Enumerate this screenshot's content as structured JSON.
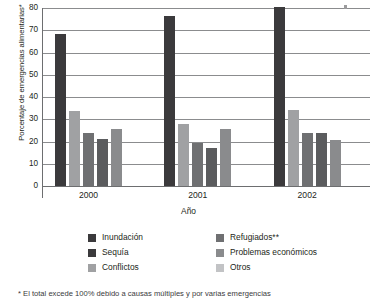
{
  "chart_data": {
    "type": "bar",
    "title": "",
    "subtitle": "",
    "xlabel": "Año",
    "ylabel": "Porcentaje de emergencias alimentarias*",
    "categories": [
      "2000",
      "2001",
      "2002"
    ],
    "ylim": [
      0,
      80
    ],
    "yticks": [
      0,
      10,
      20,
      30,
      40,
      50,
      60,
      70,
      80
    ],
    "ytick_labels": [
      "0",
      "10",
      "20",
      "30",
      "40",
      "50",
      "60",
      "70",
      "80"
    ],
    "grid": true,
    "grid_axis": "y",
    "legend_position": "bottom",
    "series": [
      {
        "name": "Inundación",
        "color": "#3b3a3c",
        "values": [
          68.5,
          76.5,
          80.5
        ]
      },
      {
        "name": "Sequía",
        "color": "#a0a1a3",
        "values": [
          33.5,
          28.0,
          34.0
        ]
      },
      {
        "name": "Conflictos",
        "color": "#6f7072",
        "values": [
          24.0,
          19.5,
          24.0
        ]
      },
      {
        "name": "Refugiados**",
        "color": "#5b5c5e",
        "values": [
          21.0,
          17.0,
          24.0
        ]
      },
      {
        "name": "Problemas económicos",
        "color": "#8a8b8d",
        "values": [
          25.5,
          25.5,
          20.5
        ]
      },
      {
        "name": "Otros",
        "color": "#c2c3c5",
        "values": [
          null,
          null,
          null
        ]
      }
    ],
    "annotations": [
      "* El total excede 100% debido a causas múltiples y por varias emergencias"
    ]
  },
  "axis": {
    "ylabel": "Porcentaje de emergencias alimentarias*",
    "xlabel": "Año"
  },
  "legend": {
    "left_column": [
      {
        "label": "Inundación",
        "color": "#3b3a3c"
      },
      {
        "label": "Sequía",
        "color": "#3b3a3c"
      },
      {
        "label": "Conflictos",
        "color": "#a0a1a3"
      }
    ],
    "right_column": [
      {
        "label": "Refugiados**",
        "color": "#6f7072"
      },
      {
        "label": "Problemas económicos",
        "color": "#8a8b8d"
      },
      {
        "label": "Otros",
        "color": "#c2c3c5"
      }
    ]
  },
  "footnote": {
    "text": "* El total excede 100% debido a causas múltiples y por varias emergencias"
  }
}
